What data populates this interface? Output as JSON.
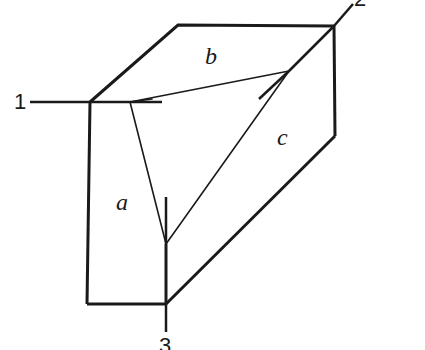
{
  "diagram": {
    "type": "crystal-cleavage-block-with-axes",
    "colors": {
      "stroke": "#1a1a1a",
      "background": "#ffffff"
    },
    "axes": [
      {
        "id": "1",
        "label": "1"
      },
      {
        "id": "2",
        "label": "2"
      },
      {
        "id": "3",
        "label": "3"
      }
    ],
    "intercepts": [
      {
        "id": "a",
        "label": "a"
      },
      {
        "id": "b",
        "label": "b"
      },
      {
        "id": "c",
        "label": "c"
      }
    ]
  }
}
